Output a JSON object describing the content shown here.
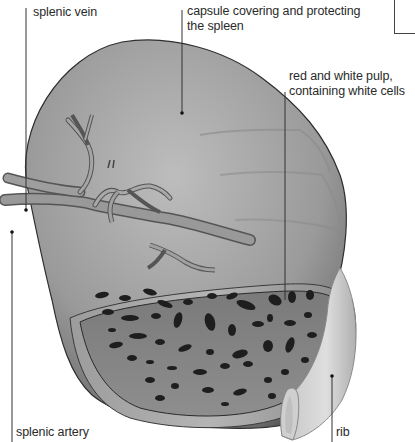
{
  "diagram": {
    "subject": "spleen",
    "labels": [
      {
        "id": "splenic-vein",
        "text": "splenic vein"
      },
      {
        "id": "capsule",
        "line1": "capsule covering and protecting",
        "line2": "the spleen"
      },
      {
        "id": "pulp",
        "line1": "red and white pulp,",
        "line2": "containing white cells"
      },
      {
        "id": "splenic-artery",
        "text": "splenic artery"
      },
      {
        "id": "rib",
        "text": "rib"
      }
    ],
    "colors": {
      "background": "#ffffff",
      "text": "#2a2a2a",
      "leader": "#333333",
      "organ_light": "#b8b8b8",
      "organ_dark": "#4a4a4a",
      "pulp": "#8a8a8a",
      "cells": "#1e1e1e",
      "rib": "#d4d4d4"
    }
  }
}
